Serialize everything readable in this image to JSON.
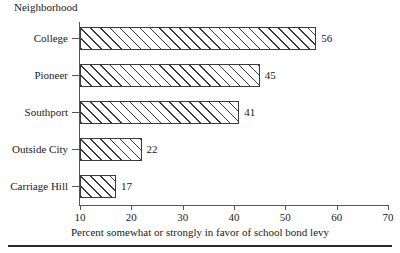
{
  "chart_data": {
    "type": "bar",
    "orientation": "horizontal",
    "title": "",
    "subtitle": "",
    "categories": [
      "College",
      "Pioneer",
      "Southport",
      "Outside City",
      "Carriage Hill"
    ],
    "values": [
      56,
      45,
      41,
      22,
      17
    ],
    "data_labels": [
      "56",
      "45",
      "41",
      "22",
      "17"
    ],
    "series": [
      {
        "name": "Percent somewhat or strongly in favor of school bond levy",
        "values": [
          56,
          45,
          41,
          22,
          17
        ]
      }
    ],
    "xlabel": "Percent somewhat or strongly in favor of school bond levy",
    "ylabel": "Neighborhood",
    "xlim": [
      10,
      70
    ],
    "xticks": [
      10,
      20,
      30,
      40,
      50,
      60,
      70
    ],
    "xtick_labels": [
      "10",
      "20",
      "30",
      "40",
      "50",
      "60",
      "70"
    ],
    "grid": false,
    "legend": false,
    "bar_fill": "hatched-diagonal",
    "colors": {
      "bar_edge": "#3a3a3a",
      "bar_hatch": "#3a3a3a",
      "bar_face": "#ffffff",
      "axis": "#555555",
      "text": "#1a1a1a",
      "rule": "#2b2b2b"
    }
  },
  "axis": {
    "group_title": "Neighborhood",
    "x_title": "Percent somewhat or strongly in favor of school bond levy",
    "ticks": [
      {
        "label": "10"
      },
      {
        "label": "20"
      },
      {
        "label": "30"
      },
      {
        "label": "40"
      },
      {
        "label": "50"
      },
      {
        "label": "60"
      },
      {
        "label": "70"
      }
    ]
  },
  "rows": [
    {
      "label": "College",
      "value": "56"
    },
    {
      "label": "Pioneer",
      "value": "45"
    },
    {
      "label": "Southport",
      "value": "41"
    },
    {
      "label": "Outside City",
      "value": "22"
    },
    {
      "label": "Carriage Hill",
      "value": "17"
    }
  ]
}
